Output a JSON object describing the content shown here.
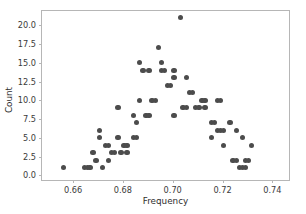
{
  "chart_data": {
    "type": "scatter",
    "title": "",
    "xlabel": "Frequency",
    "ylabel": "Count",
    "xlim": [
      0.6475,
      0.7475
    ],
    "ylim": [
      -0.9,
      21.9
    ],
    "xticks": [
      0.66,
      0.68,
      0.7,
      0.72,
      0.74
    ],
    "xticklabels": [
      "0.66",
      "0.68",
      "0.70",
      "0.72",
      "0.74"
    ],
    "yticks": [
      0.0,
      2.5,
      5.0,
      7.5,
      10.0,
      12.5,
      15.0,
      17.5,
      20.0
    ],
    "yticklabels": [
      "0.0",
      "2.5",
      "5.0",
      "7.5",
      "10.0",
      "12.5",
      "15.0",
      "17.5",
      "20.0"
    ],
    "grid": false,
    "legend": null,
    "marker": {
      "shape": "circle",
      "color": "#4c4c4c",
      "size": 5.4
    },
    "points": [
      {
        "x": 0.6562,
        "y": 1
      },
      {
        "x": 0.6645,
        "y": 1
      },
      {
        "x": 0.6657,
        "y": 1
      },
      {
        "x": 0.6668,
        "y": 1
      },
      {
        "x": 0.668,
        "y": 3
      },
      {
        "x": 0.6692,
        "y": 2
      },
      {
        "x": 0.6705,
        "y": 5
      },
      {
        "x": 0.6705,
        "y": 6
      },
      {
        "x": 0.6717,
        "y": 1
      },
      {
        "x": 0.673,
        "y": 4
      },
      {
        "x": 0.6742,
        "y": 4
      },
      {
        "x": 0.6742,
        "y": 2
      },
      {
        "x": 0.6755,
        "y": 3
      },
      {
        "x": 0.6767,
        "y": 3
      },
      {
        "x": 0.678,
        "y": 9
      },
      {
        "x": 0.678,
        "y": 5
      },
      {
        "x": 0.6792,
        "y": 3
      },
      {
        "x": 0.6805,
        "y": 4
      },
      {
        "x": 0.6817,
        "y": 4
      },
      {
        "x": 0.6817,
        "y": 3
      },
      {
        "x": 0.6842,
        "y": 8
      },
      {
        "x": 0.6842,
        "y": 5
      },
      {
        "x": 0.6855,
        "y": 7
      },
      {
        "x": 0.6855,
        "y": 5
      },
      {
        "x": 0.6867,
        "y": 15
      },
      {
        "x": 0.6867,
        "y": 10
      },
      {
        "x": 0.688,
        "y": 14
      },
      {
        "x": 0.6892,
        "y": 8
      },
      {
        "x": 0.6905,
        "y": 14
      },
      {
        "x": 0.6905,
        "y": 8
      },
      {
        "x": 0.6917,
        "y": 10
      },
      {
        "x": 0.693,
        "y": 10
      },
      {
        "x": 0.6942,
        "y": 17
      },
      {
        "x": 0.6955,
        "y": 15
      },
      {
        "x": 0.6955,
        "y": 14
      },
      {
        "x": 0.6967,
        "y": 14
      },
      {
        "x": 0.698,
        "y": 12
      },
      {
        "x": 0.6992,
        "y": 12
      },
      {
        "x": 0.7005,
        "y": 14
      },
      {
        "x": 0.7005,
        "y": 13
      },
      {
        "x": 0.7005,
        "y": 8
      },
      {
        "x": 0.703,
        "y": 21
      },
      {
        "x": 0.7042,
        "y": 9
      },
      {
        "x": 0.7055,
        "y": 9
      },
      {
        "x": 0.7055,
        "y": 13
      },
      {
        "x": 0.7067,
        "y": 11
      },
      {
        "x": 0.708,
        "y": 11
      },
      {
        "x": 0.7092,
        "y": 9
      },
      {
        "x": 0.7105,
        "y": 9
      },
      {
        "x": 0.7117,
        "y": 10
      },
      {
        "x": 0.713,
        "y": 10
      },
      {
        "x": 0.713,
        "y": 9
      },
      {
        "x": 0.7155,
        "y": 7
      },
      {
        "x": 0.7167,
        "y": 7
      },
      {
        "x": 0.7155,
        "y": 5
      },
      {
        "x": 0.718,
        "y": 10
      },
      {
        "x": 0.7192,
        "y": 10
      },
      {
        "x": 0.718,
        "y": 6
      },
      {
        "x": 0.7192,
        "y": 6
      },
      {
        "x": 0.7205,
        "y": 6
      },
      {
        "x": 0.7205,
        "y": 4
      },
      {
        "x": 0.723,
        "y": 7
      },
      {
        "x": 0.7242,
        "y": 2
      },
      {
        "x": 0.7255,
        "y": 2
      },
      {
        "x": 0.7255,
        "y": 6
      },
      {
        "x": 0.7267,
        "y": 1
      },
      {
        "x": 0.728,
        "y": 1
      },
      {
        "x": 0.7292,
        "y": 1
      },
      {
        "x": 0.728,
        "y": 5
      },
      {
        "x": 0.7292,
        "y": 2
      },
      {
        "x": 0.7305,
        "y": 2
      },
      {
        "x": 0.7317,
        "y": 4
      }
    ]
  }
}
